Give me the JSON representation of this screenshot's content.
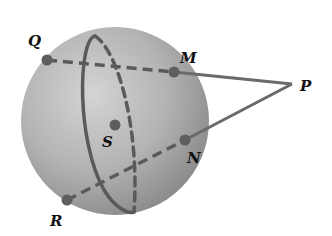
{
  "diagram": {
    "type": "sphere-geometry",
    "sphere": {
      "center": [
        115,
        121
      ],
      "radius": 94,
      "label": "S"
    },
    "points": [
      {
        "id": "Q",
        "label": "Q",
        "x": 47,
        "y": 60,
        "label_x": 28,
        "label_y": 46,
        "on_sphere": true
      },
      {
        "id": "M",
        "label": "M",
        "x": 174,
        "y": 72,
        "label_x": 180,
        "label_y": 63,
        "on_sphere": true
      },
      {
        "id": "P",
        "label": "P",
        "x": 292,
        "y": 84,
        "label_x": 300,
        "label_y": 91,
        "on_sphere": false
      },
      {
        "id": "N",
        "label": "N",
        "x": 185,
        "y": 140,
        "label_x": 187,
        "label_y": 163,
        "on_sphere": true
      },
      {
        "id": "R",
        "label": "R",
        "x": 67,
        "y": 200,
        "label_x": 50,
        "label_y": 226,
        "on_sphere": true
      },
      {
        "id": "S",
        "label": "S",
        "x": 115,
        "y": 125,
        "label_x": 102,
        "label_y": 147,
        "on_sphere": false
      }
    ],
    "segments": [
      {
        "from": "Q",
        "to": "M",
        "style": "dashed"
      },
      {
        "from": "R",
        "to": "N",
        "style": "dashed"
      },
      {
        "from": "M",
        "to": "P",
        "style": "solid"
      },
      {
        "from": "N",
        "to": "P",
        "style": "solid"
      }
    ],
    "great_circle": {
      "front": "solid",
      "back": "dashed"
    },
    "colors": {
      "line": "#5a5a5a",
      "point": "#5e5e5e",
      "sphere_highlight": "#d6d6d6",
      "sphere_shadow": "#8a8a8a",
      "label": "#111111"
    }
  }
}
